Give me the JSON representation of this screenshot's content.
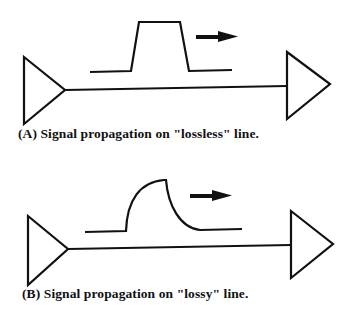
{
  "panels": [
    {
      "id": "A",
      "caption": "(A) Signal propagation on \"lossless\" line.",
      "line_type": "lossless",
      "pulse_shape": "trapezoid",
      "direction": "right"
    },
    {
      "id": "B",
      "caption": "(B) Signal propagation on \"lossy\" line.",
      "line_type": "lossy",
      "pulse_shape": "attenuated-dispersed",
      "direction": "right"
    }
  ],
  "colors": {
    "stroke": "#111111",
    "background": "#ffffff"
  }
}
